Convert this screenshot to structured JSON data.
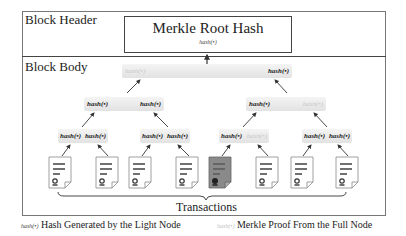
{
  "header": {
    "label": "Block Header",
    "root": {
      "title": "Merkle Root Hash",
      "hash": "hash(•)"
    }
  },
  "body": {
    "label": "Block Body",
    "levels": {
      "l1": [
        {
          "left": "hash(•)",
          "left_type": "proof",
          "right": "hash(•)",
          "right_type": "gen"
        }
      ],
      "l2": [
        {
          "left": "hash(•)",
          "left_type": "gen",
          "right": "hash(•)",
          "right_type": "gen"
        },
        {
          "left": "hash(•)",
          "left_type": "gen",
          "right": "hash(•)",
          "right_type": "proof"
        }
      ],
      "l3": [
        {
          "left": "hash(•)",
          "left_type": "gen",
          "right": "hash(•)",
          "right_type": "gen"
        },
        {
          "left": "hash(•)",
          "left_type": "gen",
          "right": "hash(•)",
          "right_type": "gen"
        },
        {
          "left": "hash(•)",
          "left_type": "gen",
          "right": "hash(•)",
          "right_type": "proof"
        },
        {
          "left": "hash(•)",
          "left_type": "gen",
          "right": "hash(•)",
          "right_type": "gen"
        }
      ]
    },
    "transactions": {
      "label": "Transactions",
      "count": 8,
      "highlighted_index": 4,
      "icon": "document-certificate-icon"
    }
  },
  "legend": [
    {
      "tag": "hash(•)",
      "tag_style": "gen",
      "text": "Hash Generated by the Light Node"
    },
    {
      "tag": "hash(•)",
      "tag_style": "proof",
      "text": "Merkle Proof From the Full Node"
    }
  ],
  "colors": {
    "generated_hash": "#222222",
    "proof_hash": "#c8c8c8",
    "highlighted_tx": "#8a8a8a",
    "node_bg": "#e8e8e8"
  }
}
